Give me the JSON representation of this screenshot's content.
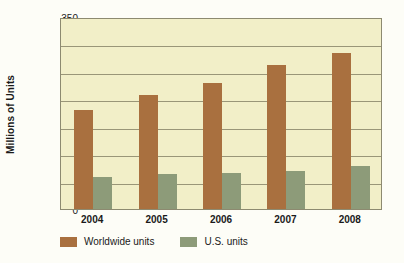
{
  "chart_data": {
    "type": "bar",
    "title": "",
    "xlabel": "",
    "ylabel": "Millions of Units",
    "categories": [
      "2004",
      "2005",
      "2006",
      "2007",
      "2008"
    ],
    "series": [
      {
        "name": "Worldwide units",
        "color": "#a9703f",
        "values": [
          180,
          207,
          230,
          262,
          285
        ]
      },
      {
        "name": "U.S. units",
        "color": "#8d9b79",
        "values": [
          58,
          63,
          66,
          70,
          78
        ]
      }
    ],
    "ylim": [
      0,
      350
    ],
    "yticks": [
      0,
      50,
      100,
      150,
      200,
      250,
      300,
      350
    ],
    "ytick_labels": [
      "0",
      "50",
      "100",
      "150",
      "200",
      "250",
      "300",
      "350"
    ],
    "grid": true,
    "legend_position": "bottom-left",
    "plot_background": "#f2efc8"
  }
}
